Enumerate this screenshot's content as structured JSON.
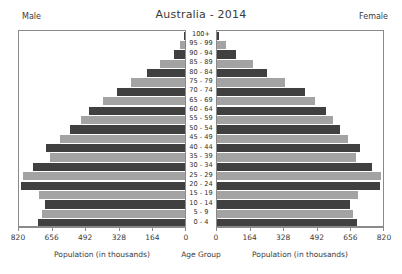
{
  "chart_data": {
    "type": "bar",
    "subtype": "population-pyramid",
    "title": "Australia - 2014",
    "left_header": "Male",
    "right_header": "Female",
    "xlabel_left": "Population (in thousands)",
    "xlabel_center": "Age Group",
    "xlabel_right": "Population (in thousands)",
    "ylabel": "Age Group",
    "grid": false,
    "legend": "none",
    "xlim": [
      0,
      820
    ],
    "tick_values": [
      0,
      164,
      328,
      492,
      656,
      820
    ],
    "left_tick_labels": [
      "820",
      "656",
      "492",
      "328",
      "164",
      "0"
    ],
    "right_tick_labels": [
      "0",
      "164",
      "328",
      "492",
      "656",
      "820"
    ],
    "categories": [
      "100+",
      "95 - 99",
      "90 - 94",
      "85 - 89",
      "80 - 84",
      "75 - 79",
      "70 - 74",
      "65 - 69",
      "60 - 64",
      "55 - 59",
      "50 - 54",
      "45 - 49",
      "40 - 44",
      "35 - 39",
      "30 - 34",
      "25 - 29",
      "20 - 24",
      "15 - 19",
      "10 - 14",
      "5 - 9",
      "0 - 4"
    ],
    "series": [
      {
        "name": "Male",
        "side": "left",
        "color": "#404040",
        "alt_color": "#a3a3a3",
        "values": [
          5,
          25,
          55,
          120,
          185,
          265,
          330,
          400,
          470,
          510,
          560,
          610,
          680,
          660,
          740,
          790,
          800,
          715,
          685,
          700,
          720
        ]
      },
      {
        "name": "Female",
        "side": "right",
        "color": "#404040",
        "alt_color": "#a3a3a3",
        "values": [
          12,
          45,
          95,
          175,
          245,
          330,
          430,
          480,
          530,
          565,
          600,
          640,
          700,
          680,
          755,
          800,
          795,
          690,
          650,
          665,
          685
        ]
      }
    ],
    "bar_styles": [
      "dark",
      "light",
      "dark",
      "light",
      "dark",
      "light",
      "dark",
      "light",
      "dark",
      "light",
      "dark",
      "light",
      "dark",
      "light",
      "dark",
      "light",
      "dark",
      "light",
      "dark",
      "light",
      "dark"
    ],
    "colors": {
      "dark_bar": "#404040",
      "light_bar": "#a3a3a3",
      "frame": "#8a8a8a",
      "text": "#3a3a3a",
      "background": "#ffffff"
    }
  }
}
